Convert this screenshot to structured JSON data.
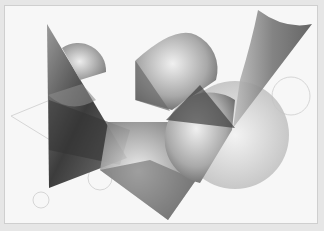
{
  "artwork": {
    "description": "Abstract grayscale watercolor composition of overlapping triangles, semicircles and circles",
    "colors": {
      "paper": "#f7f7f7",
      "frame": "#e6e6e6",
      "dark": "#3a3a3a",
      "mid": "#8a8a8a",
      "light": "#d8d8d8",
      "outline": "#d4d4d4"
    },
    "shapes": [
      "left-tall-triangle",
      "top-left-half-disc",
      "center-half-disc",
      "right-cone",
      "right-circle",
      "lower-center-triangle",
      "lower-right-disc",
      "outline-circles"
    ]
  }
}
